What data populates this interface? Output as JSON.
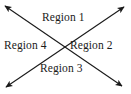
{
  "diagram": {
    "background_color": "#ffffff",
    "stroke_color": "#1a1a1a",
    "intersection": {
      "x": 63,
      "y": 46
    },
    "lines": [
      {
        "name": "line-nw-se",
        "from": {
          "x": 5,
          "y": 6
        },
        "to": {
          "x": 122,
          "y": 86
        },
        "arrow_start": true,
        "arrow_end": true
      },
      {
        "name": "line-sw-ne",
        "from": {
          "x": 6,
          "y": 87
        },
        "to": {
          "x": 124,
          "y": 7
        },
        "arrow_start": true,
        "arrow_end": true
      }
    ],
    "labels": {
      "region_1": "Region 1",
      "region_2": "Region 2",
      "region_3": "Region 3",
      "region_4": "Region 4"
    }
  }
}
